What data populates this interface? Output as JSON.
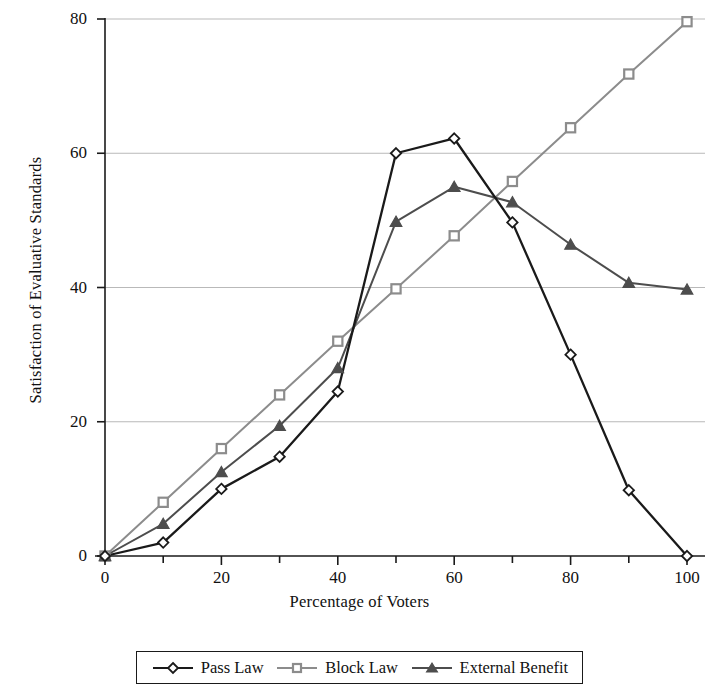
{
  "chart_data": {
    "type": "line",
    "title": "",
    "xlabel": "Percentage of Voters",
    "ylabel": "Satisfaction of Evaluative Standards",
    "xlim": [
      0,
      100
    ],
    "ylim": [
      0,
      80
    ],
    "xticks": [
      0,
      20,
      40,
      60,
      80,
      100
    ],
    "yticks": [
      0,
      20,
      40,
      60,
      80
    ],
    "xtick_labels": [
      "0",
      "20",
      "40",
      "60",
      "80",
      "100"
    ],
    "ytick_labels": [
      "0",
      "20",
      "40",
      "60",
      "80"
    ],
    "grid": "horizontal",
    "legend_position": "bottom",
    "x": [
      0,
      10,
      20,
      30,
      40,
      50,
      60,
      70,
      80,
      90,
      100
    ],
    "series": [
      {
        "name": "Pass Law",
        "marker": "diamond",
        "color": "#1a1a1a",
        "values": [
          0,
          2,
          10,
          14.8,
          24.5,
          60,
          62.2,
          49.7,
          30,
          9.8,
          0
        ]
      },
      {
        "name": "Block Law",
        "marker": "square",
        "color": "#8c8c8c",
        "values": [
          0,
          8,
          16,
          24,
          32,
          39.8,
          47.7,
          55.8,
          63.8,
          71.8,
          79.6
        ]
      },
      {
        "name": "External Benefit",
        "marker": "triangle",
        "color": "#4d4d4d",
        "values": [
          0,
          4.8,
          12.5,
          19.4,
          28,
          49.8,
          55,
          52.7,
          46.4,
          40.7,
          39.7
        ]
      }
    ]
  },
  "legend": {
    "items": [
      {
        "label": "Pass Law",
        "marker": "diamond-marker-icon",
        "color": "#1a1a1a"
      },
      {
        "label": "Block Law",
        "marker": "square-marker-icon",
        "color": "#8c8c8c"
      },
      {
        "label": "External Benefit",
        "marker": "triangle-marker-icon",
        "color": "#4d4d4d"
      }
    ]
  },
  "axes": {
    "x_title": "Percentage of Voters",
    "y_title": "Satisfaction of Evaluative Standards"
  }
}
